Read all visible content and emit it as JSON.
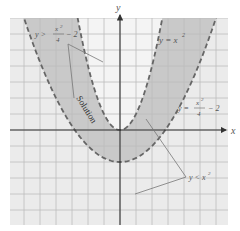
{
  "chart_data": {
    "type": "inequality-graph",
    "title": "",
    "axes": {
      "x_label": "x",
      "y_label": "y",
      "x_range": [
        -7,
        7
      ],
      "y_range": [
        -6,
        7
      ],
      "grid": true,
      "grid_unit": 1
    },
    "curves": [
      {
        "name": "y = x^2",
        "equation": "y = x²",
        "style": "dashed",
        "vertex": [
          0,
          0
        ]
      },
      {
        "name": "y = x^2/4 - 2",
        "equation": "y = x²/4 − 2",
        "style": "dashed",
        "vertex": [
          0,
          -2
        ]
      }
    ],
    "shaded_region": {
      "description": "Region between the curves satisfying y > x²/4 − 2 and y < x²",
      "inequalities": [
        "y > x²/4 − 2",
        "y < x²"
      ]
    },
    "annotations": [
      {
        "text": "y > x²/4 − 2",
        "position": "upper-left"
      },
      {
        "text": "y = x²",
        "position": "upper-right"
      },
      {
        "text": "y = x²/4 − 2",
        "position": "right"
      },
      {
        "text": "y < x²",
        "position": "lower-right"
      },
      {
        "text": "Solution",
        "position": "left-center"
      }
    ]
  },
  "labels": {
    "x_axis": "x",
    "y_axis": "y",
    "ineq_upper": "y >",
    "ineq_upper_num": "x",
    "ineq_upper_exp": "2",
    "ineq_upper_den": "4",
    "ineq_upper_tail": "− 2",
    "eq_parabola": "y = x",
    "eq_parabola_exp": "2",
    "eq_wide_lhs": "y =",
    "eq_wide_num": "x",
    "eq_wide_exp": "2",
    "eq_wide_den": "4",
    "eq_wide_tail": "− 2",
    "ineq_lower": "y < x",
    "ineq_lower_exp": "2",
    "solution": "Solution"
  },
  "colors": {
    "background": "#ebebeb",
    "shade": "#c9c9c9",
    "grid": "#bdbdbd",
    "axis": "#333333",
    "curve": "#666666"
  }
}
